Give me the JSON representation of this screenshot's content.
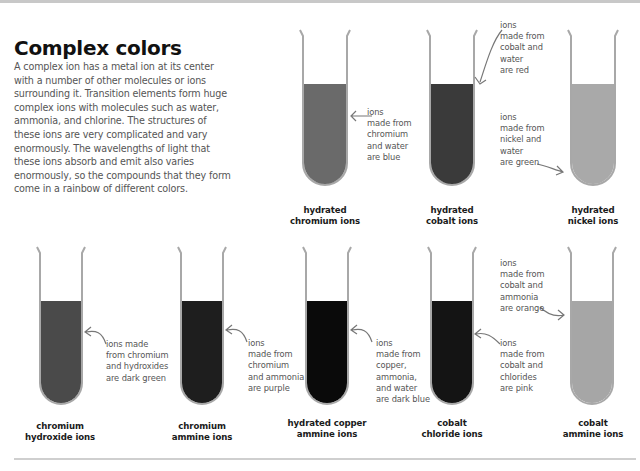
{
  "header": {
    "title": "Complex colors",
    "intro": "A complex ion has a metal ion at its center with a number of other molecules or ions surrounding it. Transition elements form huge complex ions with molecules such as water, ammonia, and chlorine. The structures of these ions are very complicated and vary enormously. The wavelengths of light that these ions absorb and emit also varies enormously, so the compounds that they form come in a rainbow of different colors."
  },
  "colors": {
    "tube_wall": "#a8a8a8",
    "chromium_hydrated": "#6a6a6a",
    "cobalt_hydrated": "#3a3a3a",
    "nickel_hydrated": "#a9a9a9",
    "chromium_hydroxide": "#4a4a4a",
    "chromium_ammine": "#1e1e1e",
    "copper_ammine": "#0a0a0a",
    "cobalt_chloride": "#141414",
    "cobalt_ammine": "#a6a6a6"
  },
  "tubes": {
    "top": [
      {
        "label": "hydrated\nchromium ions",
        "note": "ions\nmade from\nchromium\nand water\nare blue"
      },
      {
        "label": "hydrated\ncobalt ions",
        "note": "ions\nmade from\ncobalt and\nwater\nare red"
      },
      {
        "label": "hydrated\nnickel ions",
        "note": "ions\nmade from\nnickel and\nwater\nare green"
      }
    ],
    "bottom": [
      {
        "label": "chromium\nhydroxide ions",
        "note": "ions made\nfrom chromium\nand hydroxides\nare dark green"
      },
      {
        "label": "chromium\nammine ions",
        "note": "ions\nmade from\nchromium\nand ammonia\nare purple"
      },
      {
        "label": "hydrated copper\nammine ions",
        "note": "ions\nmade from\ncopper,\nammonia,\nand water\nare dark blue"
      },
      {
        "label": "cobalt\nchloride ions",
        "note": "ions\nmade from\ncobalt and\nchlorides\nare pink"
      },
      {
        "label": "cobalt\nammine ions",
        "note": "ions\nmade from\ncobalt and\nammonia\nare orange"
      }
    ]
  }
}
